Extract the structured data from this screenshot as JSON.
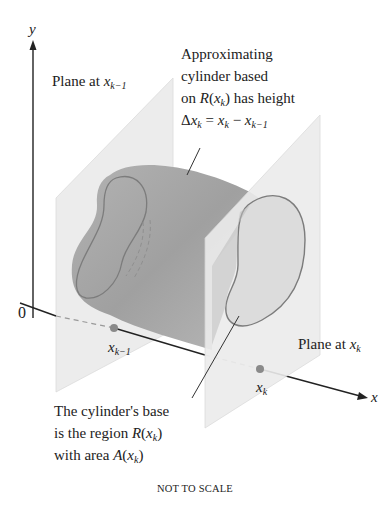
{
  "figure": {
    "axes": {
      "y_label": "y",
      "x_label": "x",
      "origin_label": "0"
    },
    "points": [
      {
        "name": "x_k_minus_1",
        "base": "x",
        "sub": "k−1"
      },
      {
        "name": "x_k",
        "base": "x",
        "sub": "k"
      }
    ],
    "annotations": {
      "plane_left": {
        "text": "Plane at ",
        "var": "x",
        "sub": "k−1"
      },
      "plane_right": {
        "text": "Plane at ",
        "var": "x",
        "sub": "k"
      },
      "cylinder": {
        "line1": "Approximating",
        "line2": "cylinder based",
        "line3_pre": "on ",
        "line3_R": "R",
        "line3_open": "(",
        "line3_x": "x",
        "line3_sub": "k",
        "line3_post": ") has height",
        "line4_delta": "Δ",
        "line4_x": "x",
        "line4_sub": "k",
        "line4_eq": " = ",
        "line4_x2": "x",
        "line4_sub2": "k",
        "line4_minus": " − ",
        "line4_x3": "x",
        "line4_sub3": "k−1"
      },
      "base": {
        "line1": "The cylinder's base",
        "line2_pre": "is the region ",
        "line2_R": "R",
        "line2_open": "(",
        "line2_x": "x",
        "line2_sub": "k",
        "line2_close": ")",
        "line3_pre": "with area ",
        "line3_A": "A",
        "line3_open": "(",
        "line3_x": "x",
        "line3_sub": "k",
        "line3_close": ")"
      }
    },
    "footer": "NOT TO SCALE",
    "colors": {
      "plane_fill": "#e9e9e9",
      "cylinder_fill": "#a9a9a9",
      "cylinder_outline": "#7e7e7e",
      "point": "#8a8a8a",
      "axis": "#222222"
    }
  }
}
